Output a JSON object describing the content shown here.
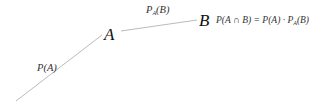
{
  "diagram": {
    "type": "probability-tree-branch",
    "nodes": [
      {
        "id": "A",
        "label": "A"
      },
      {
        "id": "B",
        "label": "B"
      }
    ],
    "edges": [
      {
        "from": "root",
        "to": "A",
        "label_main": "P(A)"
      },
      {
        "from": "A",
        "to": "B",
        "label_prefix": "P",
        "label_sub": "A",
        "label_suffix": "(B)"
      }
    ],
    "formula": {
      "lhs": "P(A ∩ B)",
      "eq": " = ",
      "rhs_1": "P(A)",
      "dot": " · ",
      "rhs_2_prefix": "P",
      "rhs_2_sub": "A",
      "rhs_2_suffix": "(B)"
    },
    "line_color": "#bbbbbb"
  }
}
